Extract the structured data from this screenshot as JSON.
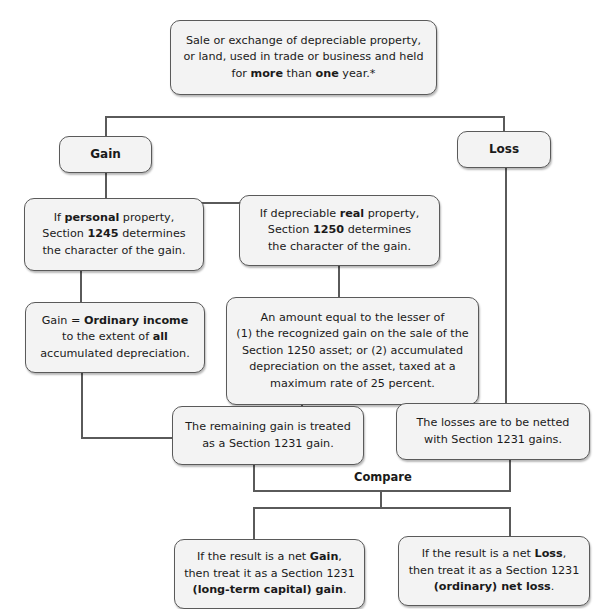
{
  "diagram": {
    "title_box": {
      "line1": "Sale or exchange of depreciable property,",
      "line2": "or land, used in trade or business and held",
      "line3_pre": "for ",
      "line3_bold1": "more",
      "line3_mid": " than ",
      "line3_bold2": "one",
      "line3_post": " year.*"
    },
    "gain_label": "Gain",
    "loss_label": "Loss",
    "personal_box": {
      "l1_pre": "If ",
      "l1_bold": "personal",
      "l1_post": " property,",
      "l2_pre": "Section ",
      "l2_bold": "1245",
      "l2_post": " determines",
      "l3": "the character of the gain."
    },
    "real_box": {
      "l1_pre": "If depreciable ",
      "l1_bold": "real",
      "l1_post": " property,",
      "l2_pre": "Section ",
      "l2_bold": "1250",
      "l2_post": " determines",
      "l3": "the character of the gain."
    },
    "ordinary_box": {
      "l1_pre": "Gain = ",
      "l1_bold": "Ordinary income",
      "l2_pre": "to the extent of ",
      "l2_bold": "all",
      "l3": "accumulated depreciation."
    },
    "section1250_box": {
      "l1": "An amount equal to the lesser of",
      "l2": "(1) the recognized gain on the sale of the",
      "l3": "Section 1250 asset; or (2) accumulated",
      "l4": "depreciation on the asset, taxed at a",
      "l5": "maximum rate of 25 percent."
    },
    "remaining_box": {
      "l1": "The remaining gain is treated",
      "l2": "as a Section 1231 gain."
    },
    "losses_box": {
      "l1": "The losses are to be netted",
      "l2": "with Section 1231 gains."
    },
    "compare_label": "Compare",
    "net_gain_box": {
      "l1_pre": "If the result is a net ",
      "l1_bold": "Gain",
      "l1_post": ",",
      "l2": "then treat it as a Section 1231",
      "l3_bold": "(long-term capital) gain",
      "l3_post": "."
    },
    "net_loss_box": {
      "l1_pre": "If the result is a net ",
      "l1_bold": "Loss",
      "l1_post": ",",
      "l2": "then treat it as a Section 1231",
      "l3_bold": "(ordinary) net loss",
      "l3_post": "."
    },
    "colors": {
      "box_fill": "#f3f3f3",
      "box_border": "#5a5a5a",
      "connector": "#5a5a5a",
      "text": "#1a1a1a"
    }
  }
}
